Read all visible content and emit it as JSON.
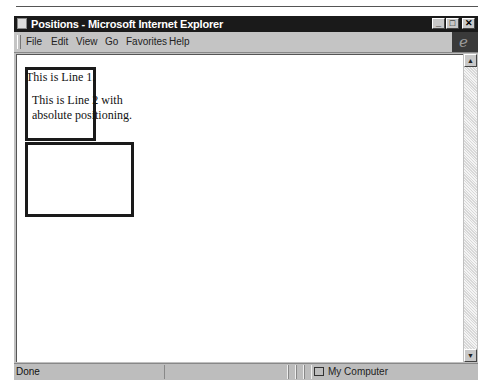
{
  "window": {
    "title": "Positions - Microsoft Internet Explorer",
    "controls": {
      "minimize": "_",
      "maximize": "□",
      "close": "✕"
    }
  },
  "menubar": {
    "items": [
      {
        "label": "File",
        "accel": "F"
      },
      {
        "label": "Edit",
        "accel": "E"
      },
      {
        "label": "View",
        "accel": "V"
      },
      {
        "label": "Go",
        "accel": "G"
      },
      {
        "label": "Favorites",
        "accel": "a"
      },
      {
        "label": "Help",
        "accel": "H"
      }
    ],
    "logo": "e"
  },
  "page": {
    "line1": "This is Line 1.",
    "line2": "This is Line 2 with absolute positioning."
  },
  "scrollbar": {
    "up": "▲",
    "down": "▼"
  },
  "statusbar": {
    "status": "Done",
    "zone": "My Computer"
  }
}
